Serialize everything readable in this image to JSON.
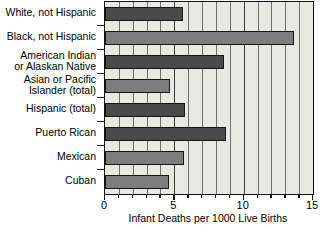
{
  "chart_data": {
    "type": "bar",
    "orientation": "horizontal",
    "title": "",
    "xlabel": "Infant Deaths per 1000 Live Births",
    "ylabel": "",
    "xlim": [
      0,
      15
    ],
    "ylim": null,
    "grid": true,
    "legend": null,
    "xticks": [
      "0",
      "5",
      "10",
      "15"
    ],
    "xtick_values": [
      0,
      5,
      10,
      15
    ],
    "minor_tick_interval": 1,
    "categories": [
      "White, not Hispanic",
      "Black, not Hispanic",
      "American Indian\nor Alaskan Native",
      "Asian or Pacific\nIslander (total)",
      "Hispanic (total)",
      "Puerto Rican",
      "Mexican",
      "Cuban"
    ],
    "values": [
      5.6,
      13.6,
      8.6,
      4.7,
      5.8,
      8.7,
      5.7,
      4.6
    ],
    "bar_colors": [
      "#4a4a4a",
      "#7d7d7d",
      "#4a4a4a",
      "#7d7d7d",
      "#4a4a4a",
      "#4a4a4a",
      "#7d7d7d",
      "#7d7d7d"
    ],
    "plot_background": "#e9e9e3",
    "axis_color": "#111111",
    "gridline_color": "#6f6f6f"
  }
}
